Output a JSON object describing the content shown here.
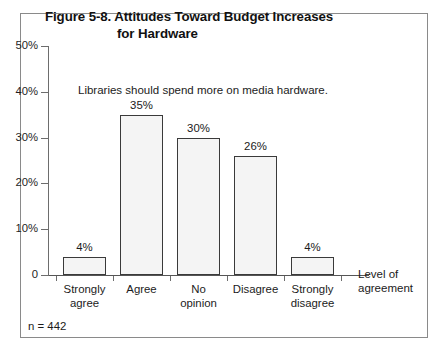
{
  "figure": {
    "title_line1": "Figure 5-8.  Attitudes Toward Budget Increases",
    "title_line2": "for Hardware",
    "sample_size": "n = 442"
  },
  "chart_data": {
    "type": "bar",
    "title": "Figure 5-8.  Attitudes Toward Budget Increases for Hardware",
    "annotation": "Libraries should spend more on media hardware.",
    "categories": [
      "Strongly agree",
      "Agree",
      "No opinion",
      "Disagree",
      "Strongly disagree"
    ],
    "category_lines": [
      [
        "Strongly",
        "agree"
      ],
      [
        "Agree",
        ""
      ],
      [
        "No",
        "opinion"
      ],
      [
        "Disagree",
        ""
      ],
      [
        "Strongly",
        "disagree"
      ]
    ],
    "values": [
      4,
      35,
      30,
      26,
      4
    ],
    "value_labels": [
      "4%",
      "35%",
      "30%",
      "26%",
      "4%"
    ],
    "xlabel_lines": [
      "Level of",
      "agreement"
    ],
    "xlabel": "Level of agreement",
    "ylabel": "",
    "ylim": [
      0,
      50
    ],
    "ytick_values": [
      0,
      10,
      20,
      30,
      40,
      50
    ],
    "ytick_labels": [
      "0",
      "10%",
      "20%",
      "30%",
      "40%",
      "50%"
    ],
    "grid": false,
    "legend": null,
    "bar_fill": "stipple-dot-pattern",
    "bar_border_color": "#3a3a3a",
    "bar_fill_color": "#f4f4f4"
  }
}
